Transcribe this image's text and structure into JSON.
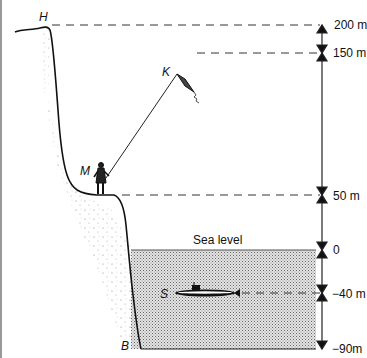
{
  "diagram": {
    "points": {
      "H": "H",
      "K": "K",
      "M": "M",
      "S": "S",
      "B": "B"
    },
    "sea_label": "Sea level",
    "levels": [
      {
        "label": "200 m",
        "value": 200
      },
      {
        "label": "150 m",
        "value": 150
      },
      {
        "label": "50 m",
        "value": 50
      },
      {
        "label": "0",
        "value": 0
      },
      {
        "label": "−40 m",
        "value": -40
      },
      {
        "label": "−90m",
        "value": -90
      }
    ],
    "colors": {
      "line": "#111111",
      "sea_fill": "#bdbdbd",
      "dash": "#333333"
    }
  }
}
